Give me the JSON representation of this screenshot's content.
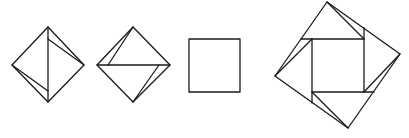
{
  "figure": {
    "stroke_color": "#1a1a1a",
    "background": "#ffffff",
    "shapes": [
      {
        "name": "diamond-vertical-fold",
        "outline": [
          [
            48,
            27
          ],
          [
            84,
            65
          ],
          [
            48,
            102
          ],
          [
            12,
            65
          ]
        ],
        "lines": [
          [
            [
              48,
              27
            ],
            [
              48,
              102
            ]
          ],
          [
            [
              48,
              39
            ],
            [
              84,
              65
            ]
          ],
          [
            [
              12,
              65
            ],
            [
              48,
              91
            ]
          ]
        ]
      },
      {
        "name": "diamond-horizontal-fold",
        "outline": [
          [
            133,
            27
          ],
          [
            170,
            65
          ],
          [
            133,
            102
          ],
          [
            97,
            65
          ]
        ],
        "lines": [
          [
            [
              97,
              65
            ],
            [
              170,
              65
            ]
          ],
          [
            [
              133,
              27
            ],
            [
              108,
              65
            ]
          ],
          [
            [
              133,
              102
            ],
            [
              159,
              65
            ]
          ]
        ]
      },
      {
        "name": "square",
        "outline": [
          [
            189,
            39
          ],
          [
            240,
            39
          ],
          [
            240,
            92
          ],
          [
            189,
            92
          ]
        ],
        "lines": []
      },
      {
        "name": "pinwheel-square",
        "outline": [
          [
            327,
            2
          ],
          [
            400,
            54
          ],
          [
            348,
            128
          ],
          [
            275,
            76
          ]
        ],
        "lines": [
          [
            [
              301,
              39
            ],
            [
              364,
              39
            ]
          ],
          [
            [
              327,
              2
            ],
            [
              364,
              39
            ]
          ],
          [
            [
              364,
              28
            ],
            [
              364,
              92
            ]
          ],
          [
            [
              400,
              54
            ],
            [
              364,
              92
            ]
          ],
          [
            [
              312,
              92
            ],
            [
              374,
              92
            ]
          ],
          [
            [
              348,
              128
            ],
            [
              312,
              92
            ]
          ],
          [
            [
              312,
              39
            ],
            [
              312,
              103
            ]
          ],
          [
            [
              275,
              76
            ],
            [
              312,
              39
            ]
          ]
        ]
      }
    ]
  }
}
